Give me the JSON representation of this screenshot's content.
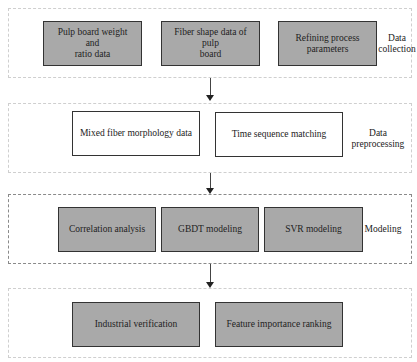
{
  "stages": [
    {
      "label": "Data collection",
      "label_lines": [
        "Data",
        "collection"
      ],
      "boxes": [
        {
          "lines": [
            "Pulp board weight and",
            "ratio data"
          ]
        },
        {
          "lines": [
            "Fiber shape data of pulp",
            "board"
          ]
        },
        {
          "lines": [
            "Refining process",
            "parameters"
          ]
        }
      ]
    },
    {
      "label": "Data preprocessing",
      "label_lines": [
        "Data",
        "preprocessing"
      ],
      "boxes": [
        {
          "lines": [
            "Mixed fiber morphology data"
          ]
        },
        {
          "lines": [
            "Time sequence matching"
          ]
        }
      ]
    },
    {
      "label": "Modeling",
      "label_lines": [
        "Modeling"
      ],
      "boxes": [
        {
          "lines": [
            "Correlation analysis"
          ]
        },
        {
          "lines": [
            "GBDT modeling"
          ]
        },
        {
          "lines": [
            "SVR modeling"
          ]
        }
      ]
    },
    {
      "label": "",
      "label_lines": [],
      "boxes": [
        {
          "lines": [
            "Industrial verification"
          ]
        },
        {
          "lines": [
            "Feature importance ranking"
          ]
        }
      ]
    }
  ],
  "colors": {
    "box_fill_gray": "#a9a9a9",
    "box_fill_white": "#ffffff",
    "box_border": "#333333",
    "stage_border_light": "#cfcfcf",
    "stage_border_dark": "#8a8a8a",
    "arrow": "#333333"
  }
}
